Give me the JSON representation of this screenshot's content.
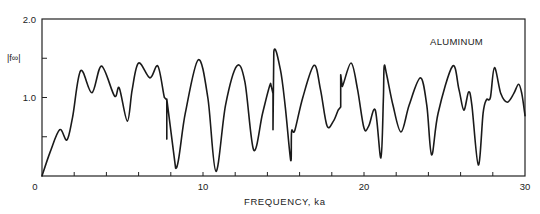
{
  "chart_data": {
    "type": "line",
    "title": "",
    "annotation": "ALUMINUM",
    "xlabel": "FREQUENCY, ka",
    "ylabel": "|f∞|",
    "xlim": [
      0,
      30
    ],
    "ylim": [
      0,
      2.0
    ],
    "x_tick_labels": [
      "0",
      "10",
      "20",
      "30"
    ],
    "x_tick_label_values": [
      0,
      10,
      20,
      30
    ],
    "x_minor_tick_step": 2,
    "y_tick_labels": [
      "1.0",
      "2.0"
    ],
    "y_tick_label_values": [
      1.0,
      2.0
    ],
    "y_minor_ticks": [
      0.5,
      1.5
    ],
    "grid": false,
    "legend": null,
    "series": [
      {
        "name": "Aluminum form function",
        "points": [
          [
            0.0,
            0.0
          ],
          [
            0.5,
            0.3
          ],
          [
            1.1,
            0.59
          ],
          [
            1.55,
            0.46
          ],
          [
            1.9,
            0.75
          ],
          [
            2.4,
            1.34
          ],
          [
            3.1,
            1.06
          ],
          [
            3.7,
            1.4
          ],
          [
            4.5,
            1.02
          ],
          [
            4.8,
            1.12
          ],
          [
            5.3,
            0.7
          ],
          [
            5.6,
            1.1
          ],
          [
            6.0,
            1.44
          ],
          [
            6.7,
            1.25
          ],
          [
            7.2,
            1.4
          ],
          [
            7.6,
            1.0
          ],
          [
            7.75,
            0.97
          ],
          [
            7.75,
            0.47
          ],
          [
            7.75,
            0.98
          ],
          [
            8.3,
            0.1
          ],
          [
            8.9,
            0.8
          ],
          [
            9.7,
            1.48
          ],
          [
            10.3,
            1.0
          ],
          [
            10.8,
            0.06
          ],
          [
            11.4,
            0.9
          ],
          [
            12.1,
            1.4
          ],
          [
            12.6,
            1.2
          ],
          [
            13.15,
            0.33
          ],
          [
            13.7,
            0.8
          ],
          [
            14.2,
            1.18
          ],
          [
            14.35,
            1.05
          ],
          [
            14.35,
            0.59
          ],
          [
            14.4,
            1.58
          ],
          [
            14.8,
            1.36
          ],
          [
            15.1,
            0.9
          ],
          [
            15.45,
            0.2
          ],
          [
            15.5,
            0.57
          ],
          [
            15.7,
            0.58
          ],
          [
            16.2,
            1.0
          ],
          [
            16.9,
            1.41
          ],
          [
            17.3,
            1.1
          ],
          [
            17.7,
            0.64
          ],
          [
            18.1,
            0.7
          ],
          [
            18.4,
            0.84
          ],
          [
            18.55,
            0.88
          ],
          [
            18.55,
            1.29
          ],
          [
            18.65,
            1.14
          ],
          [
            19.2,
            1.44
          ],
          [
            19.6,
            1.1
          ],
          [
            20.0,
            0.61
          ],
          [
            20.3,
            0.64
          ],
          [
            20.7,
            0.84
          ],
          [
            21.05,
            0.23
          ],
          [
            21.2,
            0.95
          ],
          [
            21.25,
            1.39
          ],
          [
            21.4,
            1.3
          ],
          [
            21.8,
            0.9
          ],
          [
            22.3,
            0.56
          ],
          [
            22.8,
            0.9
          ],
          [
            23.5,
            1.25
          ],
          [
            23.9,
            0.9
          ],
          [
            24.2,
            0.27
          ],
          [
            24.6,
            0.8
          ],
          [
            25.5,
            1.4
          ],
          [
            25.9,
            1.1
          ],
          [
            26.2,
            0.84
          ],
          [
            26.5,
            1.07
          ],
          [
            26.7,
            0.9
          ],
          [
            27.1,
            0.14
          ],
          [
            27.4,
            0.8
          ],
          [
            27.6,
            0.97
          ],
          [
            27.85,
            1.0
          ],
          [
            28.1,
            1.38
          ],
          [
            28.5,
            1.05
          ],
          [
            28.9,
            0.94
          ],
          [
            29.3,
            1.05
          ],
          [
            29.6,
            1.17
          ],
          [
            29.8,
            1.05
          ],
          [
            30.0,
            0.77
          ]
        ]
      }
    ],
    "axis_color": "#222222",
    "line_color": "#1a1a1a"
  }
}
